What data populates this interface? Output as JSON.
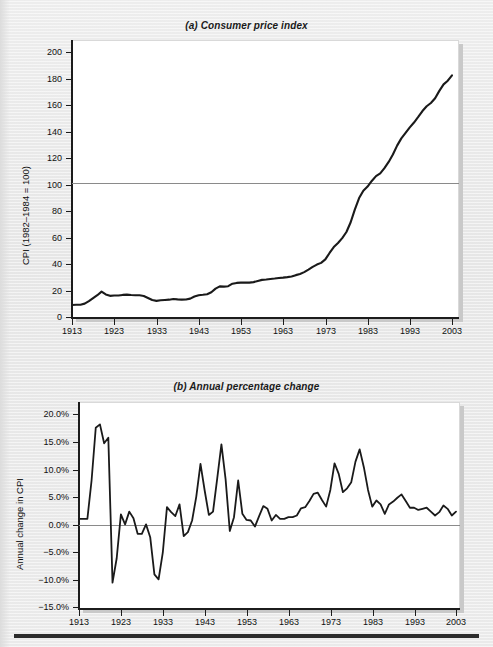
{
  "figure": {
    "background_color": "#e9e9e9",
    "line_color": "#1a1a1a",
    "zero_line_color": "#8a8a8a"
  },
  "chart_data": [
    {
      "type": "line",
      "panel": "a",
      "title": "(a) Consumer price index",
      "xlabel": "",
      "ylabel": "CPI (1982–1984 = 100)",
      "xlim": [
        1913,
        2003
      ],
      "ylim": [
        0,
        210
      ],
      "yticks": [
        0,
        20,
        40,
        60,
        80,
        100,
        120,
        140,
        160,
        180,
        200
      ],
      "ytick_labels": [
        "0",
        "20",
        "40",
        "60",
        "80",
        "100",
        "120",
        "140",
        "160",
        "180",
        "200"
      ],
      "xticks": [
        1913,
        1923,
        1933,
        1943,
        1953,
        1963,
        1973,
        1983,
        1993,
        2003
      ],
      "xtick_labels": [
        "1913",
        "1923",
        "1933",
        "1943",
        "1953",
        "1963",
        "1973",
        "1983",
        "1993",
        "2003"
      ],
      "reference_line": {
        "y": 100,
        "label": "100"
      },
      "grid": false,
      "legend": "none",
      "x": [
        1913,
        1914,
        1915,
        1916,
        1917,
        1918,
        1919,
        1920,
        1921,
        1922,
        1923,
        1924,
        1925,
        1926,
        1927,
        1928,
        1929,
        1930,
        1931,
        1932,
        1933,
        1934,
        1935,
        1936,
        1937,
        1938,
        1939,
        1940,
        1941,
        1942,
        1943,
        1944,
        1945,
        1946,
        1947,
        1948,
        1949,
        1950,
        1951,
        1952,
        1953,
        1954,
        1955,
        1956,
        1957,
        1958,
        1959,
        1960,
        1961,
        1962,
        1963,
        1964,
        1965,
        1966,
        1967,
        1968,
        1969,
        1970,
        1971,
        1972,
        1973,
        1974,
        1975,
        1976,
        1977,
        1978,
        1979,
        1980,
        1981,
        1982,
        1983,
        1984,
        1985,
        1986,
        1987,
        1988,
        1989,
        1990,
        1991,
        1992,
        1993,
        1994,
        1995,
        1996,
        1997,
        1998,
        1999,
        2000,
        2001,
        2002,
        2003
      ],
      "values": [
        9.9,
        10.0,
        10.1,
        10.9,
        12.8,
        15.1,
        17.3,
        20.0,
        17.9,
        16.8,
        17.1,
        17.1,
        17.5,
        17.7,
        17.4,
        17.2,
        17.2,
        16.7,
        15.2,
        13.6,
        13.0,
        13.4,
        13.7,
        13.9,
        14.4,
        14.1,
        13.9,
        14.0,
        14.7,
        16.3,
        17.3,
        17.6,
        18.0,
        19.5,
        22.3,
        24.0,
        23.8,
        24.1,
        26.0,
        26.6,
        26.8,
        26.9,
        26.8,
        27.2,
        28.1,
        28.9,
        29.2,
        29.6,
        29.9,
        30.3,
        30.6,
        31.0,
        31.5,
        32.5,
        33.4,
        34.8,
        36.7,
        38.8,
        40.5,
        41.8,
        44.4,
        49.3,
        53.8,
        56.9,
        60.6,
        65.2,
        72.6,
        82.4,
        90.9,
        96.5,
        99.6,
        103.9,
        107.6,
        109.6,
        113.6,
        118.3,
        124.0,
        130.7,
        136.2,
        140.3,
        144.5,
        148.2,
        152.4,
        156.9,
        160.5,
        163.0,
        166.6,
        172.2,
        177.1,
        179.9,
        184.0
      ]
    },
    {
      "type": "line",
      "panel": "b",
      "title": "(b) Annual percentage change",
      "xlabel": "",
      "ylabel": "Annual change in CPI",
      "xlim": [
        1913,
        2003
      ],
      "ylim": [
        -15.0,
        22.0
      ],
      "yticks": [
        -15.0,
        -10.0,
        -5.0,
        0.0,
        5.0,
        10.0,
        15.0,
        20.0
      ],
      "ytick_labels": [
        "−15.0%",
        "−10.0%",
        "−5.0%",
        "0.0%",
        "5.0%",
        "10.0%",
        "15.0%",
        "20.0%"
      ],
      "xticks": [
        1913,
        1923,
        1933,
        1943,
        1953,
        1963,
        1973,
        1983,
        1993,
        2003
      ],
      "xtick_labels": [
        "1913",
        "1923",
        "1933",
        "1943",
        "1953",
        "1963",
        "1973",
        "1983",
        "1993",
        "2003"
      ],
      "reference_line": {
        "y": 0,
        "label": "0.0%"
      },
      "grid": false,
      "legend": "none",
      "x": [
        1913,
        1914,
        1915,
        1916,
        1917,
        1918,
        1919,
        1920,
        1921,
        1922,
        1923,
        1924,
        1925,
        1926,
        1927,
        1928,
        1929,
        1930,
        1931,
        1932,
        1933,
        1934,
        1935,
        1936,
        1937,
        1938,
        1939,
        1940,
        1941,
        1942,
        1943,
        1944,
        1945,
        1946,
        1947,
        1948,
        1949,
        1950,
        1951,
        1952,
        1953,
        1954,
        1955,
        1956,
        1957,
        1958,
        1959,
        1960,
        1961,
        1962,
        1963,
        1964,
        1965,
        1966,
        1967,
        1968,
        1969,
        1970,
        1971,
        1972,
        1973,
        1974,
        1975,
        1976,
        1977,
        1978,
        1979,
        1980,
        1981,
        1982,
        1983,
        1984,
        1985,
        1986,
        1987,
        1988,
        1989,
        1990,
        1991,
        1992,
        1993,
        1994,
        1995,
        1996,
        1997,
        1998,
        1999,
        2000,
        2001,
        2002,
        2003
      ],
      "values": [
        1.0,
        1.0,
        1.0,
        7.9,
        17.4,
        18.0,
        14.6,
        15.6,
        -10.5,
        -6.1,
        1.8,
        0.0,
        2.3,
        1.1,
        -1.7,
        -1.7,
        0.0,
        -2.3,
        -9.0,
        -9.9,
        -5.1,
        3.1,
        2.2,
        1.5,
        3.6,
        -2.1,
        -1.4,
        0.7,
        5.0,
        10.9,
        6.1,
        1.7,
        2.3,
        8.3,
        14.4,
        8.1,
        -1.2,
        1.3,
        7.9,
        1.9,
        0.8,
        0.7,
        -0.4,
        1.5,
        3.3,
        2.8,
        0.7,
        1.7,
        1.0,
        1.0,
        1.3,
        1.3,
        1.6,
        2.9,
        3.1,
        4.2,
        5.5,
        5.7,
        4.4,
        3.2,
        6.2,
        11.0,
        9.1,
        5.8,
        6.5,
        7.6,
        11.3,
        13.5,
        10.3,
        6.2,
        3.2,
        4.3,
        3.6,
        1.9,
        3.6,
        4.1,
        4.8,
        5.4,
        4.2,
        3.0,
        3.0,
        2.6,
        2.8,
        3.0,
        2.3,
        1.6,
        2.2,
        3.4,
        2.8,
        1.6,
        2.3
      ]
    }
  ]
}
